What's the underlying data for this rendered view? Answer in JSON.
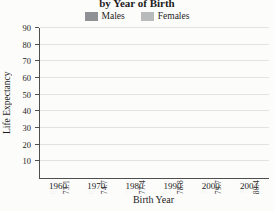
{
  "chart_data": {
    "type": "bar",
    "title": "by Year of Birth",
    "xlabel": "Birth Year",
    "ylabel": "Life Expectancy",
    "categories": [
      "1960",
      "1970",
      "1980",
      "1990",
      "2000",
      "2004"
    ],
    "series": [
      {
        "name": "Males",
        "color": "#8f9194",
        "label_color": "#f2f2f2",
        "values": [
          66.6,
          67.1,
          70.0,
          71.8,
          74.3,
          75.2
        ]
      },
      {
        "name": "Females",
        "color": "#b8babc",
        "label_color": "#333333",
        "values": [
          73.1,
          74.7,
          77.4,
          78.8,
          79.7,
          80.4
        ]
      }
    ],
    "ylim": [
      0,
      90
    ],
    "yticks": [
      10,
      20,
      30,
      40,
      50,
      60,
      70,
      80,
      90
    ],
    "grid": true,
    "legend_position": "top",
    "value_labels": true,
    "value_label_decimals": 1,
    "value_label_rotation": 90,
    "colors": {
      "grid": "#e3e3e1",
      "axis": "#4f4f4f",
      "text": "#1c1c1c",
      "background": "#fcfcfb"
    }
  }
}
